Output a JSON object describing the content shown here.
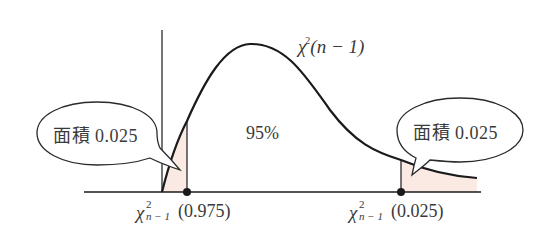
{
  "diagram": {
    "type": "chi-square-distribution-confidence-interval",
    "curve_label": {
      "symbol": "χ",
      "superscript": "2",
      "args": "(n − 1)"
    },
    "center_area_label": "95%",
    "left_tail": {
      "bubble_text": "面積 0.025",
      "critical_value": {
        "symbol": "χ",
        "superscript": "2",
        "subscript": "n − 1",
        "arg": "(0.975)"
      }
    },
    "right_tail": {
      "bubble_text": "面積 0.025",
      "critical_value": {
        "symbol": "χ",
        "superscript": "2",
        "subscript": "n − 1",
        "arg": "(0.025)"
      }
    },
    "colors": {
      "line": "#1a1a1a",
      "tail_fill": "#fbe9e4",
      "text": "#3a3a3a",
      "background": "#ffffff"
    }
  }
}
